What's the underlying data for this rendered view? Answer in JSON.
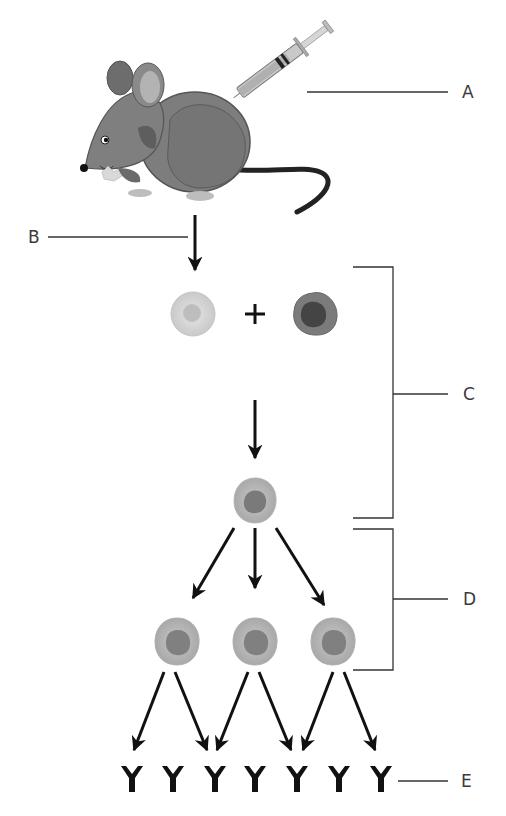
{
  "diagram": {
    "labels": {
      "a": "A",
      "b": "B",
      "c": "C",
      "d": "D",
      "e": "E"
    },
    "plus_sign": "+",
    "icons": {
      "mouse": "mouse-illustration",
      "syringe": "syringe-icon",
      "b_cell": "light-cell-icon",
      "myeloma_cell": "dark-cell-icon",
      "hybridoma": "hybridoma-cell-icon",
      "antibody": "antibody-y-icon"
    },
    "counts": {
      "daughter_cells": 3,
      "antibodies": 7
    },
    "colors": {
      "line": "#333333",
      "arrow": "#111111",
      "mouse_body": "#7a7a7a",
      "cell_light": "#d6d6d6",
      "cell_dark": "#6f6f6f",
      "antibody": "#111111"
    }
  }
}
